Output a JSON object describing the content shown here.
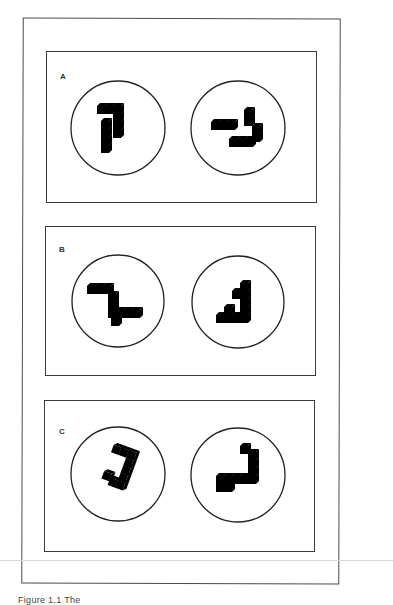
{
  "figure": {
    "panels": [
      {
        "label": "A",
        "description": "Pair of 3D cube-block figures in circles (mental rotation stimulus)",
        "items": [
          {
            "shape": "cube-figure",
            "position": "left"
          },
          {
            "shape": "cube-figure",
            "position": "right"
          }
        ]
      },
      {
        "label": "B",
        "description": "Pair of 3D cube-block figures in circles (mental rotation stimulus)",
        "items": [
          {
            "shape": "cube-figure",
            "position": "left"
          },
          {
            "shape": "cube-figure",
            "position": "right"
          }
        ]
      },
      {
        "label": "C",
        "description": "Pair of 3D cube-block figures in circles (mental rotation stimulus)",
        "items": [
          {
            "shape": "cube-figure",
            "position": "left"
          },
          {
            "shape": "cube-figure",
            "position": "right"
          }
        ]
      }
    ],
    "caption": "Figure 1.1  The"
  },
  "colors": {
    "ink": "#222222",
    "frame": "#4a4a4a",
    "background": "#ffffff"
  }
}
